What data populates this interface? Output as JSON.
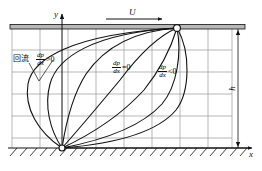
{
  "figure": {
    "title_semantic": "boundary-layer-velocity-profiles-with-pressure-gradient",
    "background": "#ffffff",
    "line_color": "#111111",
    "grid_color": "#9a9a9a",
    "plate_color": "#b8b8b8",
    "width": 262,
    "height": 171
  },
  "axes": {
    "y_label": "y",
    "x_label": "x",
    "height_label": "h"
  },
  "freestream": {
    "label": "U"
  },
  "annotations": [
    {
      "id": "backflow",
      "text": "回流",
      "numerator": "dp",
      "denominator": "dx",
      "relation": ">0"
    },
    {
      "id": "zero-gradient",
      "text": "",
      "numerator": "dp",
      "denominator": "dx",
      "relation": "=0"
    },
    {
      "id": "favorable-gradient",
      "text": "",
      "numerator": "dp",
      "denominator": "dx",
      "relation": "<0"
    }
  ],
  "grid": {
    "x_lines": [
      12,
      40,
      68,
      96,
      124,
      152,
      180,
      208,
      232
    ],
    "y_lines": [
      28,
      50,
      72,
      94,
      116,
      138,
      148
    ]
  },
  "nodes": {
    "top_point": {
      "x": 177,
      "y": 28
    },
    "bottom_point": {
      "x": 62,
      "y": 148
    }
  }
}
